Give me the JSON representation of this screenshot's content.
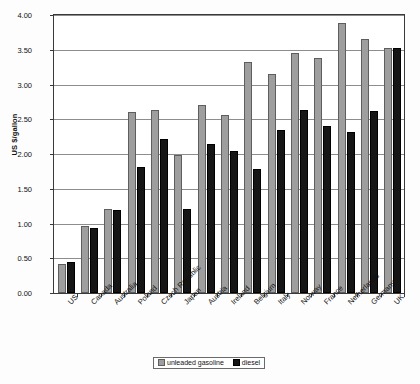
{
  "chart_data": {
    "type": "bar",
    "title": "",
    "xlabel": "",
    "ylabel": "US $/gallon",
    "ylim": [
      0,
      4.0
    ],
    "ytick_labels": [
      "0.00",
      "0.50",
      "1.00",
      "1.50",
      "2.00",
      "2.50",
      "3.00",
      "3.50",
      "4.00"
    ],
    "ytick_values": [
      0,
      0.5,
      1.0,
      1.5,
      2.0,
      2.5,
      3.0,
      3.5,
      4.0
    ],
    "grid": true,
    "legend_position": "bottom-center",
    "categories": [
      "US",
      "Canada",
      "Australia",
      "Poland",
      "Czech Republic",
      "Japan",
      "Austria",
      "Ireland",
      "Belgium",
      "Italy",
      "Norway",
      "France",
      "Netherlands",
      "Germany",
      "UK"
    ],
    "series": [
      {
        "name": "unleaded gasoline",
        "color": "#9e9e9e",
        "values": [
          0.42,
          0.96,
          1.21,
          2.6,
          2.64,
          1.99,
          2.7,
          2.56,
          3.33,
          3.15,
          3.46,
          3.38,
          3.88,
          3.65,
          3.52
        ]
      },
      {
        "name": "diesel",
        "color": "#151515",
        "values": [
          0.45,
          0.93,
          1.2,
          1.81,
          2.22,
          1.21,
          2.15,
          2.05,
          1.78,
          2.35,
          2.63,
          2.41,
          2.31,
          2.62,
          3.52
        ]
      }
    ]
  },
  "legend": {
    "items": [
      {
        "label": "unleaded gasoline"
      },
      {
        "label": "diesel"
      }
    ]
  }
}
